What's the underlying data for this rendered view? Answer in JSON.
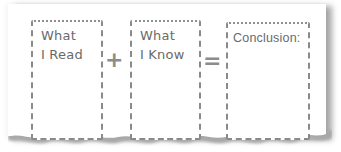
{
  "graphic": {
    "boxes": [
      {
        "label": "What\nI Read"
      },
      {
        "label": "What\nI Know"
      },
      {
        "label": "Conclusion:"
      }
    ],
    "operators": {
      "plus": "+",
      "equals": "="
    }
  },
  "colors": {
    "text": "#6a6a6a",
    "border": "#8a8a8a",
    "operator": "#8c8c8c",
    "paper": "#ffffff",
    "shadow": "#9a9a9a"
  }
}
